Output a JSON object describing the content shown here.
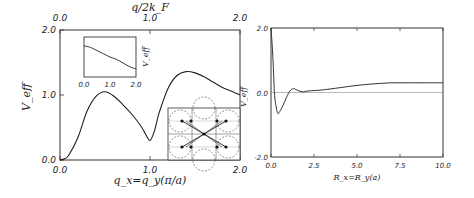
{
  "chart_data": [
    {
      "id": "left",
      "type": "line",
      "title": "",
      "xlabel": "q_x=q_y(π/a)",
      "ylabel": "V_eff",
      "top_xlabel": "q/2k_F",
      "xlim": [
        0.0,
        2.0
      ],
      "ylim": [
        0.0,
        2.0
      ],
      "xticks": [
        "0.0",
        "1.0",
        "2.0"
      ],
      "yticks": [
        "0.0",
        "1.0",
        "2.0"
      ],
      "top_xticks": [
        "0.0",
        "1.0",
        "2.0"
      ],
      "right_ylabel": "V_eff",
      "grid": false,
      "x": [
        0.0,
        0.05,
        0.1,
        0.2,
        0.3,
        0.4,
        0.5,
        0.6,
        0.7,
        0.8,
        0.9,
        0.95,
        1.0,
        1.05,
        1.1,
        1.2,
        1.3,
        1.4,
        1.5,
        1.6,
        1.7,
        1.8,
        1.9,
        2.0
      ],
      "values": [
        0.0,
        0.02,
        0.08,
        0.35,
        0.75,
        0.98,
        1.05,
        0.98,
        0.85,
        0.7,
        0.52,
        0.4,
        0.3,
        0.45,
        0.72,
        1.1,
        1.3,
        1.36,
        1.34,
        1.28,
        1.2,
        1.12,
        1.06,
        1.0
      ],
      "inset": {
        "type": "line",
        "xticks": [
          "0.0",
          "1.0",
          "2.0"
        ],
        "ylabel": "V_eff",
        "x": [
          0.0,
          0.25,
          0.5,
          0.75,
          1.0,
          1.25,
          1.5,
          1.75,
          2.0
        ],
        "values": [
          0.78,
          0.74,
          0.66,
          0.58,
          0.5,
          0.44,
          0.35,
          0.26,
          0.2
        ]
      },
      "inset_diagram": {
        "description": "Brillouin zone grid with dashed Fermi surface circles, dots and crossing arrows"
      }
    },
    {
      "id": "right",
      "type": "line",
      "title": "",
      "xlabel": "R_x=R_y(a)",
      "ylabel": "",
      "xlim": [
        0.0,
        10.0
      ],
      "ylim": [
        -2.0,
        2.0
      ],
      "xticks": [
        "0.0",
        "2.5",
        "5.0",
        "7.5",
        "10.0"
      ],
      "yticks": [
        "-2.0",
        "0.0",
        "2.0"
      ],
      "grid": false,
      "zero_line": true,
      "x": [
        0.0,
        0.1,
        0.2,
        0.3,
        0.4,
        0.5,
        0.7,
        0.9,
        1.1,
        1.3,
        1.5,
        1.8,
        2.2,
        3.0,
        4.0,
        5.0,
        6.0,
        7.0,
        8.0,
        9.0,
        10.0
      ],
      "values": [
        2.0,
        1.2,
        0.0,
        -0.45,
        -0.65,
        -0.6,
        -0.4,
        -0.15,
        0.05,
        0.12,
        0.08,
        0.02,
        0.05,
        0.08,
        0.15,
        0.22,
        0.27,
        0.3,
        0.3,
        0.3,
        0.3
      ]
    }
  ]
}
